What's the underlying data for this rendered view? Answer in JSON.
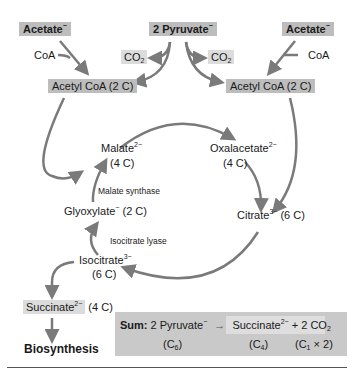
{
  "diagram": {
    "top": {
      "acetate_left": "Acetate",
      "acetate_left_charge": "−",
      "pyruvate": "2 Pyruvate",
      "pyruvate_charge": "−",
      "acetate_right": "Acetate",
      "acetate_right_charge": "−",
      "coa_left": "CoA",
      "coa_right": "CoA",
      "co2_left": "CO",
      "co2_left_sub": "2",
      "co2_right": "CO",
      "co2_right_sub": "2",
      "acetylcoa_left": "Acetyl CoA (2 C)",
      "acetylcoa_right": "Acetyl CoA (2 C)"
    },
    "cycle": {
      "malate": "Malate",
      "malate_charge": "2−",
      "malate_carbons": "(4 C)",
      "oxalacetate": "Oxalacetate",
      "oxalacetate_charge": "2−",
      "oxalacetate_carbons": "(4 C)",
      "citrate": "Citrate",
      "citrate_charge": "3−",
      "citrate_carbons": "(6 C)",
      "isocitrate": "Isocitrate",
      "isocitrate_charge": "3−",
      "isocitrate_carbons": "(6 C)",
      "glyoxylate": "Glyoxylate",
      "glyoxylate_charge": "−",
      "glyoxylate_carbons": "(2 C)",
      "enzyme_malate_synthase": "Malate synthase",
      "enzyme_isocitrate_lyase": "Isocitrate lyase"
    },
    "bottom": {
      "succinate": "Succinate",
      "succinate_charge": "2−",
      "succinate_carbons": "(4 C)",
      "biosynthesis": "Biosynthesis"
    },
    "sum": {
      "label": "Sum:",
      "reactant": "2 Pyruvate",
      "reactant_charge": "−",
      "arrow": "→",
      "product": "Succinate",
      "product_charge": "2−",
      "plus_co2": "+ 2 CO",
      "plus_co2_sub": "2",
      "c_reactant": "(C",
      "c_reactant_sub": "6",
      "c_product": "(C",
      "c_product_sub": "4",
      "c_co2": "(C",
      "c_co2_sub": "1",
      "c_co2_tail": " × 2)",
      "close": ")"
    },
    "colors": {
      "box": "#bdbdbd",
      "box_light": "#dcdcdc",
      "arrow": "#7a7a7a",
      "sum_bg": "#c9c9c9"
    }
  }
}
